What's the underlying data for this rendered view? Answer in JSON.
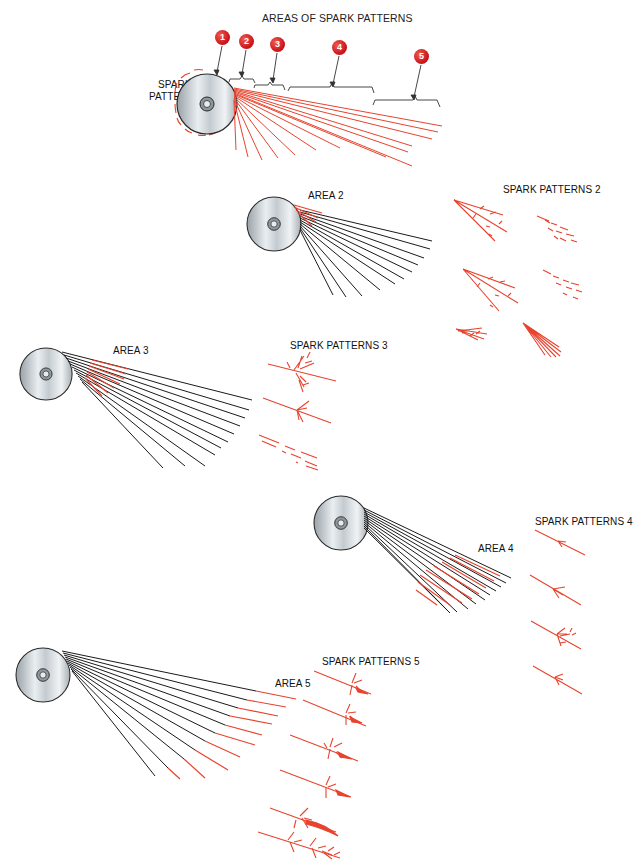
{
  "title": "AREAS OF SPARK PATTERNS",
  "colors": {
    "spark_red": "#e8432e",
    "line_black": "#1a1a1a",
    "badge_red": "#d11a1a",
    "wheel_gray": "#c9ced2"
  },
  "figure1": {
    "label_line1": "SPARK",
    "label_line2": "PATTERNS 1",
    "area_badges": [
      "1",
      "2",
      "3",
      "4",
      "5"
    ]
  },
  "panels": [
    {
      "area_label": "AREA 2",
      "pattern_label": "SPARK PATTERNS 2"
    },
    {
      "area_label": "AREA 3",
      "pattern_label": "SPARK PATTERNS 3"
    },
    {
      "area_label": "AREA 4",
      "pattern_label": "SPARK PATTERNS 4"
    },
    {
      "area_label": "AREA 5",
      "pattern_label": "SPARK PATTERNS 5"
    }
  ]
}
